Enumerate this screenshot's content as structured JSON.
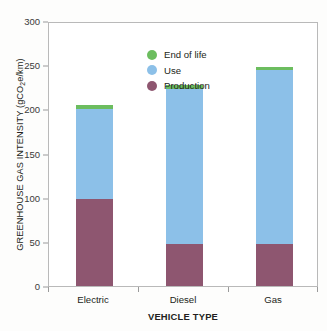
{
  "chart_data": {
    "type": "bar",
    "stacked": true,
    "title": "",
    "subtitle": "",
    "xlabel": "VEHICLE TYPE",
    "ylabel": "GREENHOUSE GAS INTENSITY (gCO2e/km)",
    "ylabel_parts": {
      "before": "GREENHOUSE GAS INTENSITY (gCO",
      "subscript": "2",
      "after": "e/km)"
    },
    "categories": [
      "Electric",
      "Diesel",
      "Gas"
    ],
    "series": [
      {
        "name": "Production",
        "color": "#8e5670",
        "values": [
          98,
          47,
          47
        ]
      },
      {
        "name": "Use",
        "color": "#8cc0e8",
        "values": [
          102,
          176,
          197
        ]
      },
      {
        "name": "End of life",
        "color": "#6cbd5f",
        "values": [
          5,
          5,
          4
        ]
      }
    ],
    "totals": [
      205,
      228,
      248
    ],
    "ylim": [
      0,
      300
    ],
    "yticks": [
      0,
      50,
      100,
      150,
      200,
      250,
      300
    ],
    "ytick_labels": [
      "0",
      "50",
      "100",
      "150",
      "200",
      "250",
      "300"
    ],
    "grid": false,
    "legend_position": "top-left-inside",
    "legend_order": [
      "End of life",
      "Use",
      "Production"
    ],
    "annotations": []
  },
  "legend": {
    "items": [
      {
        "label": "End of life",
        "color": "#6cbd5f"
      },
      {
        "label": "Use",
        "color": "#8cc0e8"
      },
      {
        "label": "Production",
        "color": "#8e5670"
      }
    ]
  },
  "colors": {
    "end_of_life": "#6cbd5f",
    "use": "#8cc0e8",
    "production": "#8e5670",
    "axis": "#9a9a9a",
    "text": "#231f20",
    "plot_border": "#b9b9b9",
    "background": "#ffffff"
  }
}
